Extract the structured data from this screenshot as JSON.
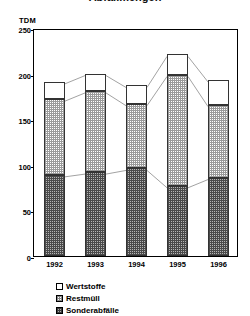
{
  "title": "Abfallmengen",
  "unit_label": "TDM",
  "legend": {
    "items": [
      {
        "key": "wertstoffe",
        "label": "Wertstoffe",
        "swatch": "white-square-icon"
      },
      {
        "key": "restmuell",
        "label": "Restmüll",
        "swatch": "light-hatched-square-icon"
      },
      {
        "key": "sonderabfaelle",
        "label": "Sonderabfälle",
        "swatch": "dark-hatched-square-icon"
      }
    ]
  },
  "chart_data": {
    "type": "bar",
    "title": "Abfallmengen",
    "xlabel": "",
    "ylabel": "TDM",
    "ylim": [
      0,
      250
    ],
    "yticks": [
      0,
      50,
      100,
      150,
      200,
      250
    ],
    "grid": false,
    "stacked": true,
    "legend_position": "bottom-left",
    "categories": [
      "1992",
      "1993",
      "1994",
      "1995",
      "1996"
    ],
    "series": [
      {
        "name": "Sonderabfälle",
        "values": [
          89,
          92,
          96,
          77,
          86
        ]
      },
      {
        "name": "Restmüll",
        "values": [
          83,
          89,
          71,
          122,
          80
        ]
      },
      {
        "name": "Wertstoffe",
        "values": [
          19,
          19,
          20,
          22,
          27
        ]
      }
    ],
    "cumulative_tops": {
      "sonderabfaelle": [
        89,
        92,
        96,
        77,
        86
      ],
      "restmuell": [
        172,
        181,
        167,
        199,
        166
      ],
      "total": [
        191,
        200,
        187,
        221,
        193
      ]
    }
  }
}
